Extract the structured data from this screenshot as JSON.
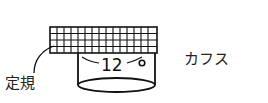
{
  "diagram": {
    "labels": {
      "ruler": "定規",
      "cuff": "カフス",
      "measurement": "12"
    },
    "colors": {
      "stroke": "#111111",
      "background": "#ffffff"
    },
    "grid": {
      "columns": 15,
      "rows": 4
    }
  }
}
